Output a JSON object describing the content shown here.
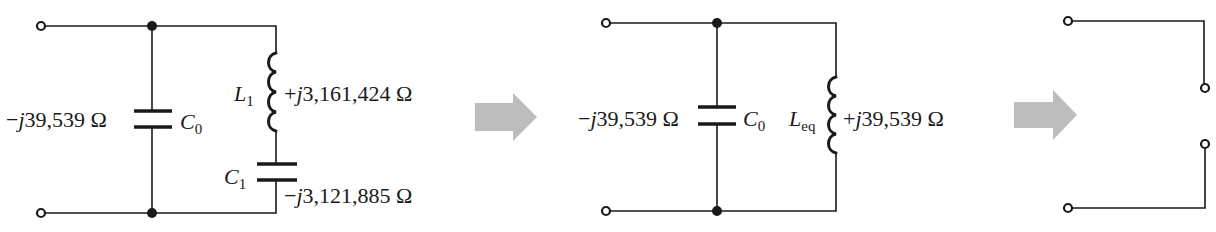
{
  "figure": {
    "colors": {
      "wire": "#1a1a1a",
      "arrow": "#bdbdbd",
      "background": "#ffffff"
    }
  },
  "circuit1": {
    "c0": {
      "name": "C",
      "sub": "0",
      "impedance": "−j39,539 Ω",
      "sign": "−",
      "j": "j",
      "value": "39,539 Ω"
    },
    "l1": {
      "name": "L",
      "sub": "1",
      "impedance": "+j3,161,424 Ω",
      "sign": "+",
      "j": "j",
      "value": "3,161,424 Ω"
    },
    "c1": {
      "name": "C",
      "sub": "1",
      "impedance": "−j3,121,885 Ω",
      "sign": "−",
      "j": "j",
      "value": "3,121,885 Ω"
    }
  },
  "circuit2": {
    "c0": {
      "name": "C",
      "sub": "0",
      "impedance": "−j39,539 Ω",
      "sign": "−",
      "j": "j",
      "value": "39,539 Ω"
    },
    "leq": {
      "name": "L",
      "sub": "eq",
      "impedance": "+j39,539 Ω",
      "sign": "+",
      "j": "j",
      "value": "39,539 Ω"
    }
  },
  "circuit3": {
    "description": "Open circuit (infinite impedance)"
  },
  "arrows": [
    {
      "id": "arrow-1",
      "direction": "right"
    },
    {
      "id": "arrow-2",
      "direction": "right"
    }
  ]
}
